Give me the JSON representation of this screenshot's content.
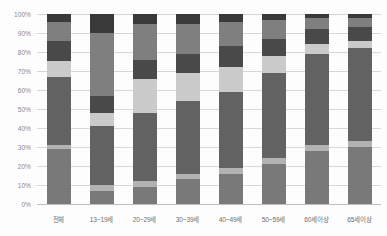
{
  "chart_data": {
    "type": "bar",
    "subtype": "100% stacked bar",
    "title": "",
    "xlabel": "",
    "ylabel": "",
    "ylim": [
      0,
      100
    ],
    "grid": true,
    "legend_position": "none",
    "categories": [
      "전체",
      "13~19세",
      "20~29세",
      "30~39세",
      "40~49세",
      "50~59세",
      "60세이상",
      "65세이상"
    ],
    "ytick_labels": [
      "0%",
      "10%",
      "20%",
      "30%",
      "40%",
      "50%",
      "60%",
      "70%",
      "80%",
      "90%",
      "100%"
    ],
    "ytick_values": [
      0,
      10,
      20,
      30,
      40,
      50,
      60,
      70,
      80,
      90,
      100
    ],
    "series": [
      {
        "name": "series-1",
        "color": "#7a7a7a",
        "values": [
          29,
          7,
          9,
          13,
          16,
          21,
          28,
          30
        ]
      },
      {
        "name": "series-2",
        "color": "#b4b4b4",
        "values": [
          2,
          3,
          3,
          3,
          3,
          3,
          3,
          3
        ]
      },
      {
        "name": "series-3",
        "color": "#636363",
        "values": [
          36,
          31,
          36,
          38,
          40,
          45,
          48,
          49
        ]
      },
      {
        "name": "series-4",
        "color": "#cccccc",
        "values": [
          8,
          7,
          18,
          15,
          13,
          9,
          5,
          4
        ]
      },
      {
        "name": "series-5",
        "color": "#4a4a4a",
        "values": [
          11,
          9,
          10,
          10,
          11,
          9,
          8,
          7
        ]
      },
      {
        "name": "series-6",
        "color": "#808080",
        "values": [
          10,
          33,
          19,
          16,
          13,
          10,
          6,
          5
        ]
      },
      {
        "name": "series-7",
        "color": "#3a3a3a",
        "values": [
          4,
          10,
          5,
          5,
          4,
          3,
          2,
          2
        ]
      }
    ]
  },
  "axis": {
    "y_color": "#8a8a8a",
    "x_color": "#6e6e6e",
    "grid_color": "#d9d9d9"
  }
}
